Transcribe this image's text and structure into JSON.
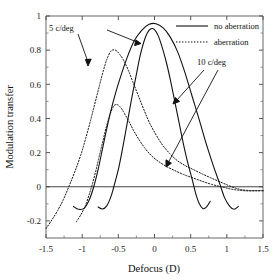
{
  "chart_data": {
    "type": "line",
    "title": "",
    "xlabel": "Defocus (D)",
    "ylabel": "Modulation transfer",
    "xlim": [
      -1.5,
      1.5
    ],
    "ylim": [
      -0.3,
      1.0
    ],
    "xticks": [
      -1.5,
      -1,
      -0.5,
      0,
      0.5,
      1,
      1.5
    ],
    "xticklabels": [
      "-1.5",
      "-1",
      "-0.5",
      "0",
      "0.5",
      "1",
      "1.5"
    ],
    "yticks": [
      -0.2,
      0,
      0.2,
      0.4,
      0.6,
      0.8,
      1
    ],
    "yticklabels": [
      "-0.2",
      "0",
      "0.2",
      "0.4",
      "0.6",
      "0.8",
      "1"
    ],
    "grid": false,
    "zero_line": true,
    "legend": {
      "position": "top-right",
      "entries": [
        {
          "label": "no aberration",
          "style": "solid"
        },
        {
          "label": "aberration",
          "style": "dotted"
        }
      ]
    },
    "annotations": [
      {
        "text": "5 c/deg",
        "x": -0.93,
        "y": 0.93
      },
      {
        "text": "10 c/deg",
        "x": 0.39,
        "y": 0.73
      }
    ],
    "series": [
      {
        "name": "no aberration 5 c/deg",
        "style": "solid",
        "peak_x": 0.02,
        "peak_y": 0.955,
        "points": [
          [
            -1.12,
            -0.115
          ],
          [
            -1.05,
            -0.132
          ],
          [
            -0.97,
            -0.125
          ],
          [
            -0.9,
            -0.075
          ],
          [
            -0.84,
            0.0
          ],
          [
            -0.78,
            0.1
          ],
          [
            -0.72,
            0.22
          ],
          [
            -0.65,
            0.36
          ],
          [
            -0.57,
            0.5
          ],
          [
            -0.48,
            0.63
          ],
          [
            -0.38,
            0.755
          ],
          [
            -0.28,
            0.855
          ],
          [
            -0.18,
            0.915
          ],
          [
            -0.08,
            0.95
          ],
          [
            0.02,
            0.955
          ],
          [
            0.12,
            0.93
          ],
          [
            0.22,
            0.875
          ],
          [
            0.32,
            0.79
          ],
          [
            0.42,
            0.67
          ],
          [
            0.52,
            0.53
          ],
          [
            0.62,
            0.39
          ],
          [
            0.72,
            0.245
          ],
          [
            0.82,
            0.115
          ],
          [
            0.9,
            0.02
          ],
          [
            0.97,
            -0.065
          ],
          [
            1.04,
            -0.115
          ],
          [
            1.1,
            -0.132
          ],
          [
            1.16,
            -0.115
          ]
        ]
      },
      {
        "name": "no aberration 10 c/deg",
        "style": "solid",
        "peak_x": -0.05,
        "peak_y": 0.925,
        "points": [
          [
            -0.78,
            -0.118
          ],
          [
            -0.72,
            -0.13
          ],
          [
            -0.66,
            -0.112
          ],
          [
            -0.6,
            -0.055
          ],
          [
            -0.55,
            0.02
          ],
          [
            -0.49,
            0.12
          ],
          [
            -0.43,
            0.25
          ],
          [
            -0.37,
            0.39
          ],
          [
            -0.31,
            0.53
          ],
          [
            -0.25,
            0.66
          ],
          [
            -0.2,
            0.765
          ],
          [
            -0.15,
            0.845
          ],
          [
            -0.1,
            0.9
          ],
          [
            -0.05,
            0.925
          ],
          [
            0.0,
            0.92
          ],
          [
            0.05,
            0.885
          ],
          [
            0.1,
            0.825
          ],
          [
            0.16,
            0.735
          ],
          [
            0.22,
            0.625
          ],
          [
            0.28,
            0.5
          ],
          [
            0.34,
            0.375
          ],
          [
            0.4,
            0.25
          ],
          [
            0.46,
            0.14
          ],
          [
            0.52,
            0.045
          ],
          [
            0.57,
            -0.04
          ],
          [
            0.62,
            -0.1
          ],
          [
            0.67,
            -0.128
          ],
          [
            0.72,
            -0.118
          ],
          [
            0.77,
            -0.085
          ]
        ]
      },
      {
        "name": "aberration 5 c/deg",
        "style": "dotted",
        "peak_x": -0.6,
        "peak_y": 0.8,
        "points": [
          [
            -1.5,
            -0.245
          ],
          [
            -1.42,
            -0.195
          ],
          [
            -1.34,
            -0.14
          ],
          [
            -1.26,
            -0.075
          ],
          [
            -1.18,
            0.005
          ],
          [
            -1.1,
            0.09
          ],
          [
            -1.02,
            0.185
          ],
          [
            -0.95,
            0.285
          ],
          [
            -0.88,
            0.395
          ],
          [
            -0.82,
            0.495
          ],
          [
            -0.76,
            0.595
          ],
          [
            -0.71,
            0.675
          ],
          [
            -0.66,
            0.745
          ],
          [
            -0.6,
            0.795
          ],
          [
            -0.54,
            0.8
          ],
          [
            -0.48,
            0.775
          ],
          [
            -0.42,
            0.735
          ],
          [
            -0.36,
            0.68
          ],
          [
            -0.3,
            0.615
          ],
          [
            -0.23,
            0.54
          ],
          [
            -0.15,
            0.455
          ],
          [
            -0.07,
            0.375
          ],
          [
            0.02,
            0.305
          ],
          [
            0.11,
            0.245
          ],
          [
            0.21,
            0.195
          ],
          [
            0.31,
            0.155
          ],
          [
            0.42,
            0.125
          ],
          [
            0.54,
            0.1
          ],
          [
            0.66,
            0.075
          ],
          [
            0.78,
            0.052
          ],
          [
            0.9,
            0.03
          ],
          [
            1.02,
            0.008
          ],
          [
            1.12,
            -0.008
          ],
          [
            1.22,
            -0.018
          ],
          [
            1.32,
            -0.022
          ],
          [
            1.42,
            -0.022
          ],
          [
            1.5,
            -0.022
          ]
        ]
      },
      {
        "name": "aberration 10 c/deg",
        "style": "dotted",
        "peak_x": -0.55,
        "peak_y": 0.48,
        "points": [
          [
            -1.08,
            -0.205
          ],
          [
            -1.02,
            -0.165
          ],
          [
            -0.96,
            -0.115
          ],
          [
            -0.91,
            -0.055
          ],
          [
            -0.86,
            0.015
          ],
          [
            -0.81,
            0.095
          ],
          [
            -0.76,
            0.185
          ],
          [
            -0.71,
            0.275
          ],
          [
            -0.66,
            0.36
          ],
          [
            -0.61,
            0.43
          ],
          [
            -0.56,
            0.475
          ],
          [
            -0.51,
            0.48
          ],
          [
            -0.46,
            0.46
          ],
          [
            -0.41,
            0.425
          ],
          [
            -0.35,
            0.38
          ],
          [
            -0.29,
            0.33
          ],
          [
            -0.22,
            0.28
          ],
          [
            -0.14,
            0.23
          ],
          [
            -0.05,
            0.185
          ],
          [
            0.05,
            0.15
          ],
          [
            0.16,
            0.12
          ],
          [
            0.28,
            0.095
          ],
          [
            0.4,
            0.072
          ],
          [
            0.53,
            0.052
          ],
          [
            0.66,
            0.032
          ],
          [
            0.79,
            0.014
          ],
          [
            0.92,
            0.0
          ],
          [
            1.04,
            -0.012
          ],
          [
            1.16,
            -0.02
          ],
          [
            1.28,
            -0.024
          ],
          [
            1.4,
            -0.024
          ],
          [
            1.5,
            -0.024
          ]
        ]
      }
    ]
  },
  "axes": {
    "x_title": "Defocus (D)",
    "y_title": "Modulation transfer"
  },
  "legend": {
    "no_aberration": "no aberration",
    "aberration": "aberration"
  },
  "labels": {
    "five_cdeg": "5 c/deg",
    "ten_cdeg": "10 c/deg"
  },
  "colors": {
    "line": "#111111",
    "axis": "#555555",
    "text": "#111111"
  }
}
